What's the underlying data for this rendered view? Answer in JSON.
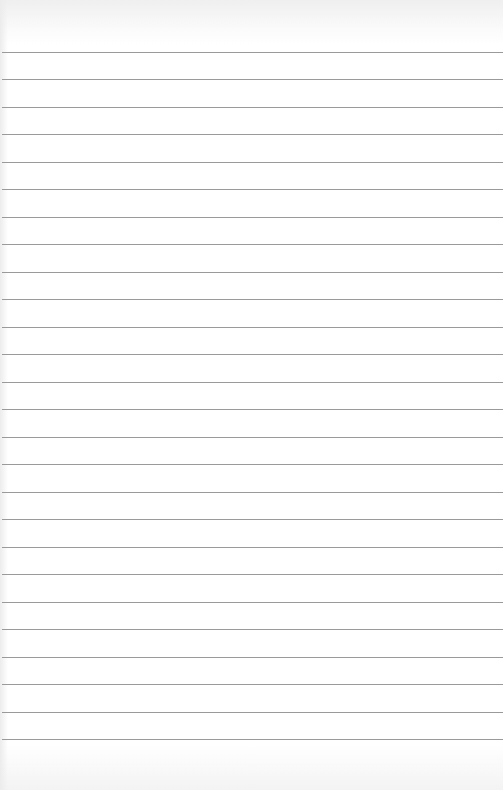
{
  "page": {
    "type": "lined-paper",
    "line_count": 26,
    "first_line_y": 52,
    "line_spacing": 27.48,
    "line_color": "#9a9a9a",
    "paper_color": "#ffffff"
  }
}
